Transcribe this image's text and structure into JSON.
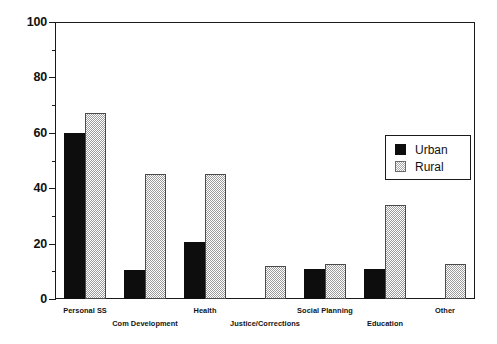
{
  "chart_data": {
    "type": "bar",
    "title": "",
    "xlabel": "",
    "ylabel": "",
    "ylim": [
      0,
      100
    ],
    "yticks": [
      0,
      20,
      40,
      60,
      80,
      100
    ],
    "ytick_labels": [
      "0",
      "20",
      "40",
      "60",
      "80",
      "100"
    ],
    "minor_yticks": [
      10,
      30,
      50,
      70,
      90
    ],
    "grid": false,
    "legend_position": "upper right",
    "categories": [
      "Personal SS",
      "Com Development",
      "Health",
      "Justice/Corrections",
      "Social Planning",
      "Education",
      "Other"
    ],
    "series": [
      {
        "name": "Urban",
        "color": "#0d0d0d",
        "pattern": "solid",
        "values": [
          60,
          10.5,
          20.5,
          0,
          11,
          11,
          0
        ]
      },
      {
        "name": "Rural",
        "color": "#9c9c9c",
        "pattern": "checkerboard",
        "values": [
          67,
          45,
          45,
          12,
          12.5,
          34,
          12.5
        ]
      }
    ]
  },
  "legend": {
    "items": [
      {
        "label": "Urban"
      },
      {
        "label": "Rural"
      }
    ]
  },
  "axis": {
    "y_tick_labels": [
      "100",
      "80",
      "60",
      "40",
      "20",
      "0"
    ]
  }
}
